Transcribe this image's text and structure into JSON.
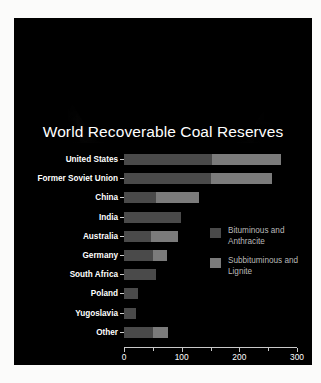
{
  "figure": {
    "background": "#fbfbfa",
    "panel_background": "#000000"
  },
  "artwork": {
    "name": "crescent-moon-photo",
    "description": "Crescent moon lit from below behind the chart title"
  },
  "chart_data": {
    "type": "bar",
    "orientation": "horizontal",
    "stacked": true,
    "title": "World Recoverable Coal Reserves",
    "xlabel": "Billion Short Tons",
    "ylabel": "",
    "xlim": [
      0,
      300
    ],
    "xticks": [
      0,
      100,
      200,
      300
    ],
    "xtick_labels": [
      "0",
      "100",
      "200",
      "300"
    ],
    "xminor_ticks": [
      50,
      150,
      250
    ],
    "grid": false,
    "legend_position": "center-right",
    "categories": [
      "United States",
      "Former Soviet Union",
      "China",
      "India",
      "Australia",
      "Germany",
      "South Africa",
      "Poland",
      "Yugoslavia",
      "Other"
    ],
    "series": [
      {
        "name": "Bituminous and Anthracite",
        "color": "#4a4a4a",
        "values": [
          153,
          150,
          55,
          98,
          46,
          50,
          55,
          24,
          20,
          50
        ]
      },
      {
        "name": "Subbituminous and Lignite",
        "color": "#7b7b7b",
        "values": [
          120,
          107,
          75,
          0,
          48,
          25,
          0,
          0,
          0,
          27
        ]
      }
    ],
    "totals": [
      273,
      257,
      130,
      98,
      94,
      75,
      55,
      24,
      20,
      77
    ]
  },
  "legend": {
    "items": [
      {
        "label": "Bituminous and Anthracite",
        "color": "#4a4a4a"
      },
      {
        "label": "Subbituminous and Lignite",
        "color": "#7b7b7b"
      }
    ]
  }
}
